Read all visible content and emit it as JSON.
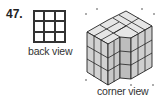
{
  "problem": {
    "number": "47.",
    "back_view": {
      "label": "back view",
      "grid_rows": 3,
      "grid_cols": 3
    },
    "corner_view": {
      "label": "corner view"
    }
  }
}
